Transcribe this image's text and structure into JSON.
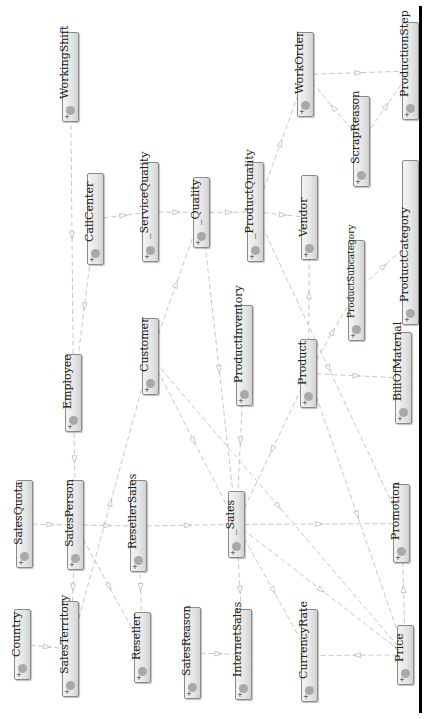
{
  "diagram": {
    "title": "",
    "orientation": "rotated-90-ccw",
    "colors": {
      "node_border": "#8a8a8a",
      "node_fill": "#e4e4e4",
      "node_dot": "#a9a9a9",
      "edge": "#c8c8c8",
      "frame_line": "#000000"
    },
    "nodes": [
      {
        "id": "WorkingShift",
        "label": "WorkingShift",
        "x": 62,
        "y": 32,
        "h": 90,
        "small": false
      },
      {
        "id": "CallCenter",
        "label": "CallCenter",
        "x": 87,
        "y": 173,
        "h": 92,
        "small": false
      },
      {
        "id": "ServiceQuality",
        "label": "_ServiceQuality",
        "x": 142,
        "y": 162,
        "h": 100,
        "small": false
      },
      {
        "id": "Quality",
        "label": "_Quality",
        "x": 193,
        "y": 177,
        "h": 71,
        "small": false
      },
      {
        "id": "ProductQuality",
        "label": "_ProductQuality",
        "x": 247,
        "y": 162,
        "h": 100,
        "small": false
      },
      {
        "id": "Vendor",
        "label": "Vendor",
        "x": 301,
        "y": 175,
        "h": 85,
        "small": false
      },
      {
        "id": "WorkOrder",
        "label": "WorkOrder",
        "x": 297,
        "y": 32,
        "h": 85,
        "small": false
      },
      {
        "id": "ScrapReason",
        "label": "ScrapReason",
        "x": 353,
        "y": 96,
        "h": 91,
        "small": false
      },
      {
        "id": "ProductionStep",
        "label": "ProductionStep",
        "x": 402,
        "y": 22,
        "h": 98,
        "small": false
      },
      {
        "id": "ProductCategory",
        "label": "ProductCategory",
        "x": 402,
        "y": 160,
        "h": 165,
        "small": false
      },
      {
        "id": "ProductSubcategory",
        "label": "ProductSubcategory",
        "x": 348,
        "y": 240,
        "h": 101,
        "small": true
      },
      {
        "id": "Product",
        "label": "Product",
        "x": 300,
        "y": 339,
        "h": 69,
        "small": false
      },
      {
        "id": "BillOfMaterial",
        "label": "BillOfMaterial",
        "x": 395,
        "y": 332,
        "h": 92,
        "small": false
      },
      {
        "id": "ProductInventory",
        "label": "ProductInventory",
        "x": 236,
        "y": 305,
        "h": 101,
        "small": false
      },
      {
        "id": "Customer",
        "label": "Customer",
        "x": 142,
        "y": 318,
        "h": 77,
        "small": false
      },
      {
        "id": "Employee",
        "label": "Employee",
        "x": 65,
        "y": 354,
        "h": 78,
        "small": false
      },
      {
        "id": "SalesQuota",
        "label": "SalesQuota",
        "x": 16,
        "y": 480,
        "h": 88,
        "small": false
      },
      {
        "id": "SalesPerson",
        "label": "SalesPerson",
        "x": 67,
        "y": 480,
        "h": 90,
        "small": false
      },
      {
        "id": "ResellerSales",
        "label": "ResellerSales",
        "x": 130,
        "y": 480,
        "h": 92,
        "small": false
      },
      {
        "id": "Sales",
        "label": "_Sales",
        "x": 228,
        "y": 491,
        "h": 67,
        "small": false
      },
      {
        "id": "Promotion",
        "label": "Promotion",
        "x": 393,
        "y": 484,
        "h": 79,
        "small": false
      },
      {
        "id": "SalesTerritory",
        "label": "SalesTerritory",
        "x": 62,
        "y": 601,
        "h": 96,
        "small": false
      },
      {
        "id": "Country",
        "label": "Country",
        "x": 14,
        "y": 609,
        "h": 71,
        "small": false
      },
      {
        "id": "Reseller",
        "label": "Reseller",
        "x": 134,
        "y": 612,
        "h": 71,
        "small": false
      },
      {
        "id": "SalesReason",
        "label": "SalesReason",
        "x": 184,
        "y": 607,
        "h": 92,
        "small": false
      },
      {
        "id": "InternetSales",
        "label": "InternetSales",
        "x": 235,
        "y": 609,
        "h": 91,
        "small": false
      },
      {
        "id": "CurrencyRate",
        "label": "CurrencyRate",
        "x": 301,
        "y": 609,
        "h": 93,
        "small": false
      },
      {
        "id": "Price",
        "label": "Price",
        "x": 397,
        "y": 625,
        "h": 60,
        "small": false
      }
    ],
    "edges": [
      {
        "from": "WorkingShift",
        "to": "Employee"
      },
      {
        "from": "CallCenter",
        "to": "ServiceQuality"
      },
      {
        "from": "ServiceQuality",
        "to": "Quality"
      },
      {
        "from": "Quality",
        "to": "ProductQuality"
      },
      {
        "from": "ProductQuality",
        "to": "Vendor"
      },
      {
        "from": "ProductQuality",
        "to": "WorkOrder"
      },
      {
        "from": "WorkOrder",
        "to": "ProductionStep"
      },
      {
        "from": "ScrapReason",
        "to": "WorkOrder"
      },
      {
        "from": "ScrapReason",
        "to": "ProductionStep"
      },
      {
        "from": "CallCenter",
        "to": "Employee"
      },
      {
        "from": "Product",
        "to": "Vendor"
      },
      {
        "from": "Product",
        "to": "ProductSubcategory"
      },
      {
        "from": "ProductSubcategory",
        "to": "ProductCategory"
      },
      {
        "from": "Product",
        "to": "BillOfMaterial"
      },
      {
        "from": "Customer",
        "to": "Quality"
      },
      {
        "from": "Employee",
        "to": "SalesPerson"
      },
      {
        "from": "SalesQuota",
        "to": "SalesPerson"
      },
      {
        "from": "SalesPerson",
        "to": "ResellerSales"
      },
      {
        "from": "ResellerSales",
        "to": "Sales"
      },
      {
        "from": "Sales",
        "to": "Promotion"
      },
      {
        "from": "SalesPerson",
        "to": "SalesTerritory"
      },
      {
        "from": "SalesPerson",
        "to": "Reseller"
      },
      {
        "from": "ResellerSales",
        "to": "Reseller"
      },
      {
        "from": "Country",
        "to": "SalesTerritory"
      },
      {
        "from": "SalesTerritory",
        "to": "Customer"
      },
      {
        "from": "Sales",
        "to": "InternetSales"
      },
      {
        "from": "SalesReason",
        "to": "InternetSales"
      },
      {
        "from": "Sales",
        "to": "CurrencyRate"
      },
      {
        "from": "Price",
        "to": "CurrencyRate"
      },
      {
        "from": "Price",
        "to": "Promotion"
      },
      {
        "from": "Sales",
        "to": "Price"
      },
      {
        "from": "Customer",
        "to": "Sales"
      },
      {
        "from": "Customer",
        "to": "Price"
      },
      {
        "from": "Product",
        "to": "Sales"
      },
      {
        "from": "ProductInventory",
        "to": "Sales"
      },
      {
        "from": "Product",
        "to": "Price"
      },
      {
        "from": "Quality",
        "to": "Sales"
      },
      {
        "from": "ProductQuality",
        "to": "Promotion"
      }
    ],
    "expand_marker": "+"
  }
}
